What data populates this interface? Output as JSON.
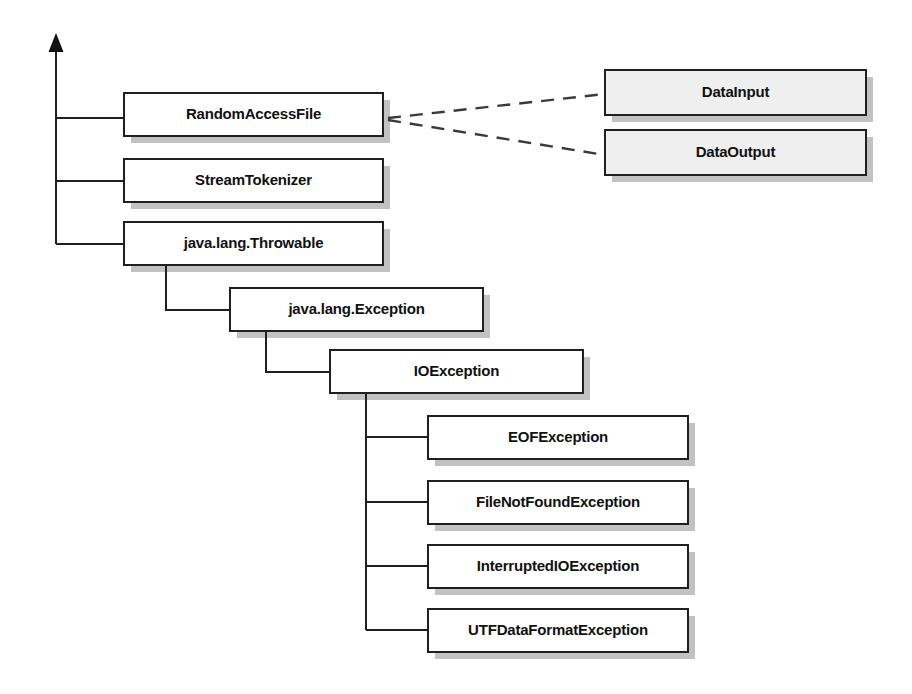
{
  "diagram": {
    "type": "uml-class-hierarchy",
    "canvas": {
      "width": 912,
      "height": 694,
      "background": "#ffffff"
    },
    "style": {
      "class_fill": "#ffffff",
      "interface_fill": "#efefef",
      "border_color": "#231f20",
      "shadow_color": "#c2c2c2",
      "text_color": "#111111",
      "edge_color": "#231f20",
      "shadow_offset": 7,
      "border_width": 2
    },
    "root_connector": {
      "name": "inheritance-root-trunk",
      "arrow_tip_x": 56,
      "arrow_tip_y": 33,
      "arrow_width": 15,
      "arrow_height": 19,
      "trunk_x": 56,
      "trunk_top_y": 52,
      "trunk_bottom_y": 244
    },
    "nodes": [
      {
        "id": "random-access-file",
        "label": "RandomAccessFile",
        "kind": "class",
        "x": 124,
        "y": 93,
        "w": 259,
        "h": 43
      },
      {
        "id": "stream-tokenizer",
        "label": "StreamTokenizer",
        "kind": "class",
        "x": 124,
        "y": 159,
        "w": 259,
        "h": 43
      },
      {
        "id": "java-lang-throwable",
        "label": "java.lang.Throwable",
        "kind": "class",
        "x": 124,
        "y": 222,
        "w": 259,
        "h": 43
      },
      {
        "id": "java-lang-exception",
        "label": "java.lang.Exception",
        "kind": "class",
        "x": 230,
        "y": 288,
        "w": 253,
        "h": 43
      },
      {
        "id": "io-exception",
        "label": "IOException",
        "kind": "class",
        "x": 330,
        "y": 350,
        "w": 253,
        "h": 43
      },
      {
        "id": "eof-exception",
        "label": "EOFException",
        "kind": "class",
        "x": 428,
        "y": 416,
        "w": 260,
        "h": 43
      },
      {
        "id": "file-not-found-exception",
        "label": "FileNotFoundException",
        "kind": "class",
        "x": 428,
        "y": 481,
        "w": 260,
        "h": 43
      },
      {
        "id": "interrupted-io-exception",
        "label": "InterruptedIOException",
        "kind": "class",
        "x": 428,
        "y": 545,
        "w": 260,
        "h": 43
      },
      {
        "id": "utf-data-format-exception",
        "label": "UTFDataFormatException",
        "kind": "class",
        "x": 428,
        "y": 609,
        "w": 260,
        "h": 43
      },
      {
        "id": "data-input",
        "label": "DataInput",
        "kind": "interface",
        "x": 605,
        "y": 70,
        "w": 261,
        "h": 45
      },
      {
        "id": "data-output",
        "label": "DataOutput",
        "kind": "interface",
        "x": 605,
        "y": 130,
        "w": 261,
        "h": 45
      }
    ],
    "edges": [
      {
        "id": "trunk-to-random-access-file",
        "kind": "inheritance",
        "from": "root",
        "to": "random-access-file",
        "points": "56,118 124,118"
      },
      {
        "id": "trunk-to-stream-tokenizer",
        "kind": "inheritance",
        "from": "root",
        "to": "stream-tokenizer",
        "points": "56,181 124,181"
      },
      {
        "id": "trunk-to-java-lang-throwable",
        "kind": "inheritance",
        "from": "root",
        "to": "java-lang-throwable",
        "points": "56,244 124,244"
      },
      {
        "id": "throwable-to-exception",
        "kind": "inheritance",
        "from": "java-lang-throwable",
        "to": "java-lang-exception",
        "points": "166,265 166,310 230,310"
      },
      {
        "id": "exception-to-io-exception",
        "kind": "inheritance",
        "from": "java-lang-exception",
        "to": "io-exception",
        "points": "266,331 266,372 330,372"
      },
      {
        "id": "io-exception-trunk",
        "kind": "inheritance-trunk",
        "from": "io-exception",
        "to": "io-exception-children",
        "points": "366,393 366,630"
      },
      {
        "id": "io-exception-to-eof",
        "kind": "inheritance",
        "from": "io-exception",
        "to": "eof-exception",
        "points": "366,437 428,437"
      },
      {
        "id": "io-exception-to-file-not-found",
        "kind": "inheritance",
        "from": "io-exception",
        "to": "file-not-found-exception",
        "points": "366,502 428,502"
      },
      {
        "id": "io-exception-to-interrupted-io",
        "kind": "inheritance",
        "from": "io-exception",
        "to": "interrupted-io-exception",
        "points": "366,566 428,566"
      },
      {
        "id": "io-exception-to-utf-data-format",
        "kind": "inheritance",
        "from": "io-exception",
        "to": "utf-data-format-exception",
        "points": "366,630 428,630"
      },
      {
        "id": "random-access-file-implements-data-input",
        "kind": "realization",
        "from": "random-access-file",
        "to": "data-input",
        "points": "388,118 605,94"
      },
      {
        "id": "random-access-file-implements-data-output",
        "kind": "realization",
        "from": "random-access-file",
        "to": "data-output",
        "points": "388,120 605,155"
      }
    ]
  }
}
